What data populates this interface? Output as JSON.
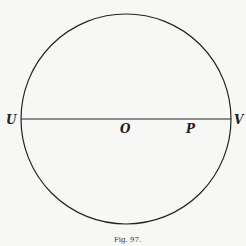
{
  "figure": {
    "caption": "Fig. 97.",
    "circle": {
      "cx": 126,
      "cy": 119,
      "r": 105
    },
    "diameter": {
      "x1": 21,
      "x2": 231,
      "y": 119
    },
    "labels": {
      "U": "U",
      "O": "O",
      "P": "P",
      "V": "V"
    },
    "colors": {
      "stroke": "#222222",
      "background": "#f7f7f5"
    }
  }
}
